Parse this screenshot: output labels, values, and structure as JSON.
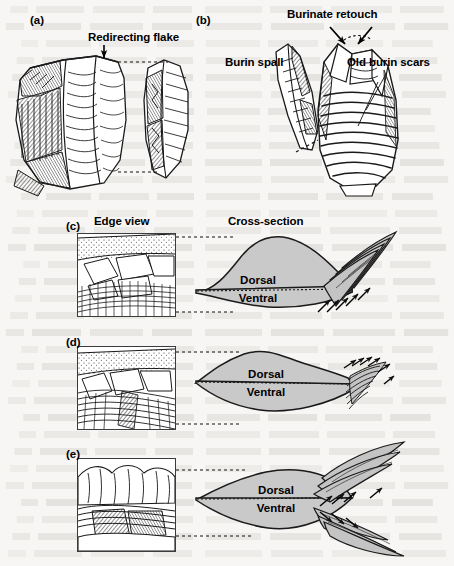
{
  "figure": {
    "background_color": "#f7f6f4",
    "ink_color": "#1a1a1a",
    "section_fill": "#c9c9c9",
    "spall_fill": "#c0c0c0"
  },
  "panels": [
    {
      "id": "(a)",
      "id_x": 30,
      "id_y": 14,
      "labels": [
        {
          "name": "redirecting-flake",
          "text": "Redirecting flake",
          "x": 88,
          "y": 38
        }
      ]
    },
    {
      "id": "(b)",
      "id_x": 196,
      "id_y": 14,
      "labels": [
        {
          "name": "burinate-retouch",
          "text": "Burinate retouch",
          "x": 287,
          "y": 12
        },
        {
          "name": "burin-spall",
          "text": "Burin spall",
          "x": 225,
          "y": 62
        },
        {
          "name": "old-burin-scars",
          "text": "Old burin scars",
          "x": 347,
          "y": 62
        }
      ]
    },
    {
      "id": "(c)",
      "id_x": 66,
      "id_y": 220,
      "edge_view_label": "Edge view",
      "edge_view_label_x": 117,
      "edge_view_label_y": 220,
      "cross_section_label": "Cross-section",
      "cross_section_label_x": 252,
      "cross_section_label_y": 220,
      "dorsal": "Dorsal",
      "ventral": "Ventral",
      "dorsal_x": 250,
      "dorsal_y": 282,
      "ventral_x": 250,
      "ventral_y": 296
    },
    {
      "id": "(d)",
      "id_x": 66,
      "id_y": 336,
      "dorsal": "Dorsal",
      "ventral": "Ventral",
      "dorsal_x": 258,
      "dorsal_y": 375,
      "ventral_x": 258,
      "ventral_y": 390
    },
    {
      "id": "(e)",
      "id_x": 66,
      "id_y": 448,
      "dorsal": "Dorsal",
      "ventral": "Ventral",
      "dorsal_x": 268,
      "dorsal_y": 492,
      "ventral_x": 268,
      "ventral_y": 507
    }
  ],
  "edge_boxes": [
    {
      "name": "edge-view-box-c",
      "x": 77,
      "y": 233,
      "w": 97,
      "h": 82
    },
    {
      "name": "edge-view-box-d",
      "x": 77,
      "y": 346,
      "w": 97,
      "h": 82
    },
    {
      "name": "edge-view-box-e",
      "x": 77,
      "y": 458,
      "w": 97,
      "h": 92
    }
  ]
}
